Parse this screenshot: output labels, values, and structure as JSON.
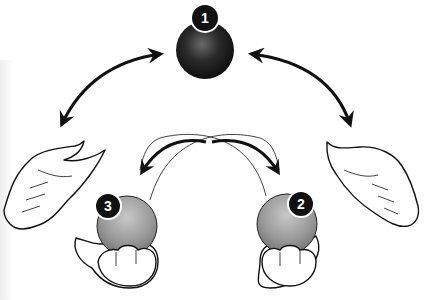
{
  "diagram": {
    "colors": {
      "background": "#ffffff",
      "line": "#111111",
      "ball_dark": "#1a1a1a",
      "ball_grey": "#9a9a9a",
      "badge": "#111111",
      "badge_text": "#ffffff"
    },
    "balls": [
      {
        "id": 1,
        "label": "1",
        "position": "top-center",
        "shade": "dark"
      },
      {
        "id": 2,
        "label": "2",
        "position": "bottom-right-hand",
        "shade": "grey"
      },
      {
        "id": 3,
        "label": "3",
        "position": "bottom-left-hand",
        "shade": "grey"
      }
    ],
    "hands": [
      {
        "name": "left-open-hand",
        "position": "left"
      },
      {
        "name": "right-open-hand",
        "position": "right"
      },
      {
        "name": "left-cupped-hand",
        "position": "bottom-left"
      },
      {
        "name": "right-cupped-hand",
        "position": "bottom-right"
      }
    ],
    "arrows": [
      {
        "name": "arrow-left-top",
        "from": "ball 1",
        "to": "left hand",
        "type": "double-headed curved"
      },
      {
        "name": "arrow-right-top",
        "from": "ball 1",
        "to": "right hand",
        "type": "double-headed curved"
      },
      {
        "name": "arrow-cross-left",
        "from": "ball 2",
        "to": "ball 3",
        "type": "curved crossing"
      },
      {
        "name": "arrow-cross-right",
        "from": "ball 3",
        "to": "ball 2",
        "type": "curved crossing"
      }
    ]
  }
}
